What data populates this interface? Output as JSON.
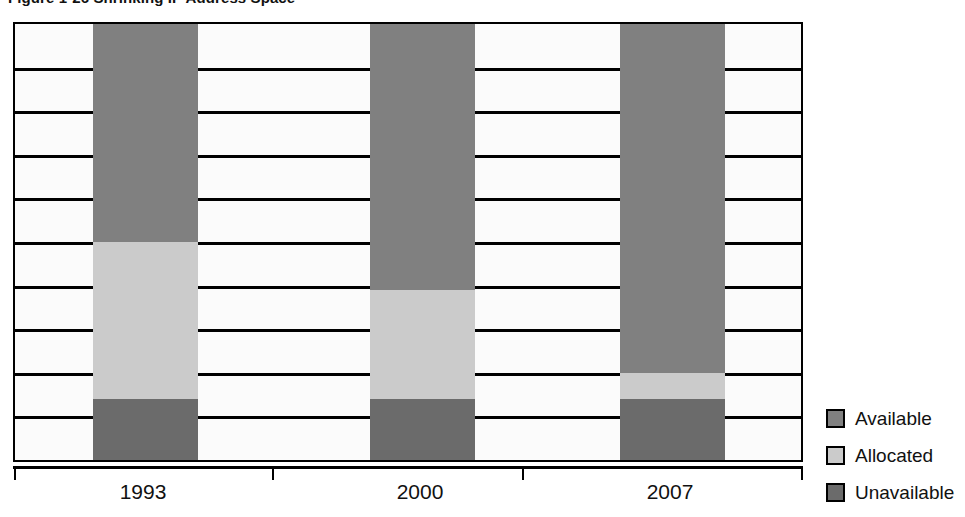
{
  "figure": {
    "title": "Figure 1-26   Shrinking IP Address Space"
  },
  "axis": {
    "x_labels": [
      "1993",
      "2000",
      "2007"
    ]
  },
  "legend": {
    "items": [
      {
        "label": "Available",
        "color": "#808080"
      },
      {
        "label": "Allocated",
        "color": "#cbcbcb"
      },
      {
        "label": "Unavailable",
        "color": "#6b6b6b"
      }
    ]
  },
  "chart_data": {
    "type": "bar",
    "subtype": "stacked-100-percent",
    "title": "Figure 1-26   Shrinking IP Address Space",
    "xlabel": "",
    "ylabel": "",
    "ylim": [
      0,
      100
    ],
    "grid": true,
    "gridline_count": 10,
    "y_tick_labels": [],
    "legend_position": "right",
    "categories": [
      "1993",
      "2000",
      "2007"
    ],
    "series": [
      {
        "name": "Available",
        "color": "#808080",
        "values": [
          50,
          61,
          80
        ]
      },
      {
        "name": "Allocated",
        "color": "#cbcbcb",
        "values": [
          36,
          25,
          6
        ]
      },
      {
        "name": "Unavailable",
        "color": "#6b6b6b",
        "values": [
          14,
          14,
          14
        ]
      }
    ],
    "stack_order_top_to_bottom": [
      "Available",
      "Allocated",
      "Unavailable"
    ]
  }
}
